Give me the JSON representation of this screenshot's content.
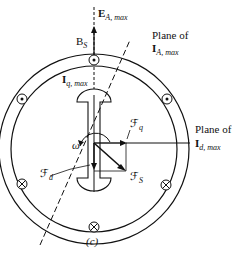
{
  "figure": {
    "panel_label": "(c)",
    "labels": {
      "e_a_max": {
        "main": "E",
        "sub": "A, max"
      },
      "b_s": {
        "main": "B",
        "sub": "S"
      },
      "i_q_max": {
        "main": "I",
        "sub": "q, max"
      },
      "plane_ia_line1": "Plane of",
      "plane_ia": {
        "main": "I",
        "sub": "A, max"
      },
      "plane_id_line1": "Plane of",
      "plane_id": {
        "main": "I",
        "sub": "d, max"
      },
      "f_q": {
        "main": "ℱ",
        "sub": "q"
      },
      "f_d": {
        "main": "ℱ",
        "sub": "d"
      },
      "f_s": {
        "main": "ℱ",
        "sub": "S"
      },
      "omega": "ω"
    },
    "conductors": [
      {
        "type": "dot",
        "position": "top"
      },
      {
        "type": "dot",
        "position": "upper-left"
      },
      {
        "type": "dot",
        "position": "upper-right"
      },
      {
        "type": "cross",
        "position": "lower-left"
      },
      {
        "type": "cross",
        "position": "lower-right"
      },
      {
        "type": "cross",
        "position": "bottom"
      }
    ],
    "colors": {
      "ink": "#111111",
      "background": "#ffffff"
    }
  }
}
